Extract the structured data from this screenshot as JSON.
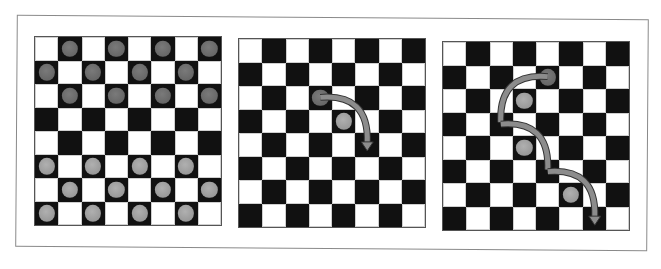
{
  "figure": {
    "colors": {
      "dark_square": "#111111",
      "light_square": "#ffffff",
      "dark_piece": "#6e6e6e",
      "light_piece": "#a0a0a0",
      "arrow": "#8c8c8c",
      "frame": "#8a8a8a"
    },
    "boards": [
      {
        "name": "initial-position",
        "left": 34,
        "top": 36,
        "dark_pieces": [
          [
            0,
            1
          ],
          [
            0,
            3
          ],
          [
            0,
            5
          ],
          [
            0,
            7
          ],
          [
            1,
            0
          ],
          [
            1,
            2
          ],
          [
            1,
            4
          ],
          [
            1,
            6
          ],
          [
            2,
            1
          ],
          [
            2,
            3
          ],
          [
            2,
            5
          ],
          [
            2,
            7
          ]
        ],
        "light_pieces": [
          [
            5,
            0
          ],
          [
            5,
            2
          ],
          [
            5,
            4
          ],
          [
            5,
            6
          ],
          [
            6,
            1
          ],
          [
            6,
            3
          ],
          [
            6,
            5
          ],
          [
            6,
            7
          ],
          [
            7,
            0
          ],
          [
            7,
            2
          ],
          [
            7,
            4
          ],
          [
            7,
            6
          ]
        ],
        "arrows": []
      },
      {
        "name": "single-jump",
        "left": 238,
        "top": 38,
        "dark_pieces": [
          [
            2,
            3
          ]
        ],
        "light_pieces": [
          [
            3,
            4
          ]
        ],
        "arrows": [
          [
            [
              2,
              3
            ],
            [
              4,
              5
            ]
          ]
        ]
      },
      {
        "name": "multi-jump",
        "left": 442,
        "top": 41,
        "dark_pieces": [
          [
            1,
            4
          ]
        ],
        "light_pieces": [
          [
            2,
            3
          ],
          [
            4,
            3
          ],
          [
            6,
            5
          ]
        ],
        "arrows": [
          [
            [
              1,
              4
            ],
            [
              3,
              2
            ]
          ],
          [
            [
              3,
              2
            ],
            [
              5,
              4
            ]
          ],
          [
            [
              5,
              4
            ],
            [
              7,
              6
            ]
          ]
        ]
      }
    ]
  }
}
